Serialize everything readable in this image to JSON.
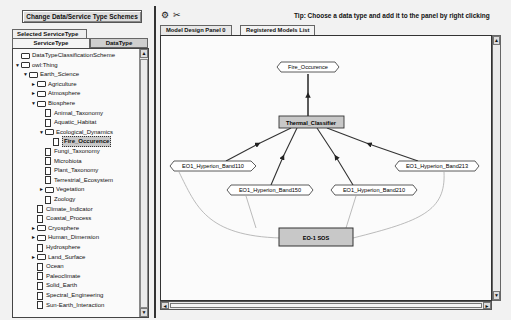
{
  "left_panel": {
    "change_button": "Change Data/Service Type Schemes",
    "selected_tab": "Selected ServiceType",
    "subtabs": [
      {
        "label": "ServiceType",
        "active": true
      },
      {
        "label": "DataType",
        "active": false
      }
    ],
    "tree": [
      {
        "label": "DataTypeClassificationScheme",
        "depth": 0,
        "type": "folder",
        "toggle": ""
      },
      {
        "label": "owl:Thing",
        "depth": 0,
        "type": "folder",
        "toggle": "▼"
      },
      {
        "label": "Earth_Science",
        "depth": 1,
        "type": "folder",
        "toggle": "▼"
      },
      {
        "label": "Agriculture",
        "depth": 2,
        "type": "folder",
        "toggle": "►"
      },
      {
        "label": "Atmosphere",
        "depth": 2,
        "type": "folder",
        "toggle": "►"
      },
      {
        "label": "Biosphere",
        "depth": 2,
        "type": "folder",
        "toggle": "▼"
      },
      {
        "label": "Animal_Taxonomy",
        "depth": 3,
        "type": "doc",
        "toggle": ""
      },
      {
        "label": "Aquatic_Habitat",
        "depth": 3,
        "type": "doc",
        "toggle": ""
      },
      {
        "label": "Ecological_Dynamics",
        "depth": 3,
        "type": "folder",
        "toggle": "▼"
      },
      {
        "label": "Fire_Occurence",
        "depth": 4,
        "type": "doc",
        "toggle": "",
        "selected": true
      },
      {
        "label": "Fungi_Taxonomy",
        "depth": 3,
        "type": "doc",
        "toggle": ""
      },
      {
        "label": "Microbiota",
        "depth": 3,
        "type": "doc",
        "toggle": ""
      },
      {
        "label": "Plant_Taxonomy",
        "depth": 3,
        "type": "doc",
        "toggle": ""
      },
      {
        "label": "Terrestrial_Ecosystem",
        "depth": 3,
        "type": "doc",
        "toggle": ""
      },
      {
        "label": "Vegetation",
        "depth": 3,
        "type": "folder",
        "toggle": "►"
      },
      {
        "label": "Zoology",
        "depth": 3,
        "type": "doc",
        "toggle": ""
      },
      {
        "label": "Climate_Indicator",
        "depth": 2,
        "type": "doc",
        "toggle": ""
      },
      {
        "label": "Coastal_Process",
        "depth": 2,
        "type": "doc",
        "toggle": ""
      },
      {
        "label": "Cryosphere",
        "depth": 2,
        "type": "folder",
        "toggle": "►"
      },
      {
        "label": "Human_Dimension",
        "depth": 2,
        "type": "folder",
        "toggle": "►"
      },
      {
        "label": "Hydrosphere",
        "depth": 2,
        "type": "doc",
        "toggle": ""
      },
      {
        "label": "Land_Surface",
        "depth": 2,
        "type": "folder",
        "toggle": "►"
      },
      {
        "label": "Ocean",
        "depth": 2,
        "type": "doc",
        "toggle": ""
      },
      {
        "label": "Paleoclimate",
        "depth": 2,
        "type": "doc",
        "toggle": ""
      },
      {
        "label": "Solid_Earth",
        "depth": 2,
        "type": "doc",
        "toggle": ""
      },
      {
        "label": "Spectral_Engineering",
        "depth": 2,
        "type": "doc",
        "toggle": ""
      },
      {
        "label": "Sun-Earth_Interaction",
        "depth": 2,
        "type": "doc",
        "toggle": ""
      }
    ],
    "scroll_up": "▲",
    "scroll_down": "▼"
  },
  "right_panel": {
    "toolbar_icons": [
      {
        "name": "gear-icon",
        "glyph": "⚙"
      },
      {
        "name": "cut-icon",
        "glyph": "✂"
      }
    ],
    "tip": "Tip: Choose a data type and add it to the panel by right clicking",
    "tabs": [
      {
        "label": "Model Design Panel 0",
        "active": true
      },
      {
        "label": "Registered Models List",
        "active": false
      }
    ],
    "diagram": {
      "nodes": {
        "fire": "Fire_Occurence",
        "classifier": "Thermal_Classifier",
        "band110": "EO1_Hyperion_Band110",
        "band150": "EO1_Hyperion_Band150",
        "band210": "EO1_Hyperion_Band210",
        "band213": "EO1_Hyperion_Band213",
        "sos": "EO-1 SOS"
      },
      "colors": {
        "box_fill": "#c8c8c8",
        "octagon_fill": "#ffffff",
        "edge_dark": "#333333",
        "edge_light": "#aaaaaa"
      }
    },
    "scroll_left": "◄",
    "scroll_right": "►",
    "scroll_up": "▲",
    "scroll_down": "▼"
  }
}
